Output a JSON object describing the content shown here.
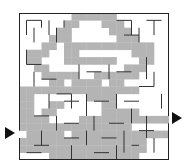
{
  "maze": {
    "cols": 20,
    "rows": 20,
    "entry": {
      "side": "left",
      "row": 16
    },
    "exit": {
      "side": "right",
      "row": 14
    },
    "colors": {
      "background": "#ffffff",
      "wall": "#333333",
      "border": "#222222",
      "solution": "#b4b4b4",
      "arrow": "#111111"
    },
    "solution_cells": [
      [
        0,
        7
      ],
      [
        0,
        8
      ],
      [
        0,
        9
      ],
      [
        0,
        10
      ],
      [
        0,
        11
      ],
      [
        0,
        12
      ],
      [
        1,
        6
      ],
      [
        1,
        7
      ],
      [
        1,
        11
      ],
      [
        1,
        12
      ],
      [
        1,
        13
      ],
      [
        2,
        5
      ],
      [
        2,
        6
      ],
      [
        2,
        12
      ],
      [
        2,
        13
      ],
      [
        2,
        14
      ],
      [
        3,
        4
      ],
      [
        3,
        5
      ],
      [
        3,
        6
      ],
      [
        3,
        13
      ],
      [
        3,
        14
      ],
      [
        3,
        15
      ],
      [
        4,
        3
      ],
      [
        4,
        4
      ],
      [
        4,
        6
      ],
      [
        4,
        7
      ],
      [
        4,
        8
      ],
      [
        4,
        9
      ],
      [
        4,
        10
      ],
      [
        4,
        11
      ],
      [
        4,
        12
      ],
      [
        4,
        13
      ],
      [
        4,
        14
      ],
      [
        4,
        15
      ],
      [
        4,
        16
      ],
      [
        4,
        17
      ],
      [
        5,
        1
      ],
      [
        5,
        2
      ],
      [
        5,
        3
      ],
      [
        5,
        6
      ],
      [
        5,
        7
      ],
      [
        5,
        15
      ],
      [
        5,
        16
      ],
      [
        5,
        17
      ],
      [
        6,
        1
      ],
      [
        6,
        2
      ],
      [
        6,
        6
      ],
      [
        6,
        7
      ],
      [
        6,
        8
      ],
      [
        6,
        9
      ],
      [
        6,
        10
      ],
      [
        6,
        11
      ],
      [
        6,
        12
      ],
      [
        6,
        16
      ],
      [
        6,
        17
      ],
      [
        7,
        2
      ],
      [
        7,
        3
      ],
      [
        7,
        14
      ],
      [
        7,
        15
      ],
      [
        7,
        16
      ],
      [
        8,
        3
      ],
      [
        8,
        4
      ],
      [
        8,
        5
      ],
      [
        8,
        6
      ],
      [
        8,
        7
      ],
      [
        8,
        10
      ],
      [
        8,
        11
      ],
      [
        8,
        12
      ],
      [
        8,
        13
      ],
      [
        8,
        14
      ],
      [
        8,
        15
      ],
      [
        9,
        4
      ],
      [
        9,
        5
      ],
      [
        9,
        7
      ],
      [
        9,
        8
      ],
      [
        9,
        9
      ],
      [
        9,
        10
      ],
      [
        9,
        12
      ],
      [
        9,
        13
      ],
      [
        10,
        0
      ],
      [
        10,
        1
      ],
      [
        10,
        2
      ],
      [
        10,
        3
      ],
      [
        10,
        4
      ],
      [
        10,
        5
      ],
      [
        10,
        6
      ],
      [
        10,
        7
      ],
      [
        10,
        8
      ],
      [
        10,
        9
      ],
      [
        10,
        10
      ],
      [
        10,
        11
      ],
      [
        10,
        12
      ],
      [
        10,
        13
      ],
      [
        10,
        14
      ],
      [
        10,
        15
      ],
      [
        11,
        0
      ],
      [
        11,
        1
      ],
      [
        11,
        9
      ],
      [
        11,
        10
      ],
      [
        11,
        11
      ],
      [
        11,
        12
      ],
      [
        12,
        0
      ],
      [
        12,
        1
      ],
      [
        12,
        4
      ],
      [
        12,
        5
      ],
      [
        12,
        11
      ],
      [
        12,
        12
      ],
      [
        13,
        0
      ],
      [
        13,
        1
      ],
      [
        13,
        3
      ],
      [
        13,
        4
      ],
      [
        13,
        11
      ],
      [
        13,
        12
      ],
      [
        13,
        13
      ],
      [
        13,
        14
      ],
      [
        13,
        15
      ],
      [
        14,
        0
      ],
      [
        14,
        1
      ],
      [
        14,
        2
      ],
      [
        14,
        3
      ],
      [
        14,
        8
      ],
      [
        14,
        9
      ],
      [
        14,
        10
      ],
      [
        14,
        11
      ],
      [
        14,
        12
      ],
      [
        14,
        13
      ],
      [
        14,
        14
      ],
      [
        14,
        15
      ],
      [
        14,
        16
      ],
      [
        14,
        17
      ],
      [
        14,
        18
      ],
      [
        14,
        19
      ],
      [
        15,
        0
      ],
      [
        15,
        1
      ],
      [
        15,
        2
      ],
      [
        15,
        3
      ],
      [
        15,
        4
      ],
      [
        15,
        5
      ],
      [
        15,
        6
      ],
      [
        15,
        7
      ],
      [
        15,
        8
      ],
      [
        15,
        9
      ],
      [
        15,
        10
      ],
      [
        15,
        11
      ],
      [
        15,
        12
      ],
      [
        15,
        13
      ],
      [
        15,
        14
      ],
      [
        16,
        1
      ],
      [
        16,
        2
      ],
      [
        16,
        3
      ],
      [
        16,
        4
      ],
      [
        16,
        5
      ],
      [
        16,
        7
      ],
      [
        16,
        8
      ],
      [
        16,
        9
      ],
      [
        16,
        10
      ],
      [
        16,
        11
      ],
      [
        16,
        12
      ],
      [
        16,
        13
      ],
      [
        16,
        14
      ],
      [
        16,
        15
      ],
      [
        16,
        16
      ],
      [
        16,
        17
      ],
      [
        16,
        18
      ],
      [
        16,
        19
      ],
      [
        17,
        0
      ],
      [
        17,
        1
      ],
      [
        17,
        2
      ],
      [
        17,
        3
      ],
      [
        17,
        4
      ],
      [
        17,
        5
      ],
      [
        17,
        6
      ],
      [
        17,
        7
      ],
      [
        17,
        8
      ],
      [
        17,
        9
      ],
      [
        17,
        10
      ],
      [
        17,
        11
      ],
      [
        17,
        12
      ],
      [
        17,
        13
      ],
      [
        17,
        14
      ],
      [
        17,
        15
      ],
      [
        17,
        16
      ],
      [
        18,
        0
      ],
      [
        18,
        1
      ],
      [
        18,
        2
      ],
      [
        18,
        3
      ],
      [
        18,
        4
      ],
      [
        18,
        5
      ],
      [
        18,
        6
      ],
      [
        18,
        7
      ],
      [
        18,
        8
      ],
      [
        18,
        9
      ],
      [
        18,
        10
      ],
      [
        18,
        11
      ],
      [
        18,
        12
      ],
      [
        18,
        13
      ],
      [
        18,
        14
      ],
      [
        18,
        15
      ],
      [
        18,
        16
      ],
      [
        19,
        4
      ],
      [
        19,
        5
      ],
      [
        19,
        6
      ],
      [
        19,
        7
      ],
      [
        19,
        8
      ],
      [
        19,
        9
      ],
      [
        19,
        10
      ],
      [
        19,
        11
      ],
      [
        19,
        12
      ],
      [
        19,
        13
      ],
      [
        19,
        14
      ],
      [
        19,
        15
      ]
    ],
    "walls": [
      [
        1,
        1,
        1,
        3
      ],
      [
        1,
        1,
        3,
        1
      ],
      [
        3,
        1,
        3,
        2
      ],
      [
        2,
        2,
        2,
        4
      ],
      [
        4,
        1,
        4,
        3
      ],
      [
        5,
        2,
        5,
        4
      ],
      [
        6,
        1,
        6,
        2
      ],
      [
        13,
        1,
        15,
        1
      ],
      [
        15,
        1,
        15,
        3
      ],
      [
        16,
        2,
        16,
        4
      ],
      [
        17,
        1,
        19,
        1
      ],
      [
        18,
        1,
        18,
        3
      ],
      [
        14,
        3,
        16,
        3
      ],
      [
        1,
        5,
        1,
        7
      ],
      [
        1,
        7,
        3,
        7
      ],
      [
        2,
        8,
        2,
        10
      ],
      [
        3,
        9,
        5,
        9
      ],
      [
        4,
        11,
        4,
        13
      ],
      [
        6,
        12,
        8,
        12
      ],
      [
        8,
        7,
        8,
        9
      ],
      [
        9,
        8,
        11,
        8
      ],
      [
        12,
        7,
        12,
        9
      ],
      [
        13,
        8,
        15,
        8
      ],
      [
        17,
        6,
        17,
        9
      ],
      [
        18,
        8,
        18,
        10
      ],
      [
        5,
        11,
        7,
        11
      ],
      [
        7,
        11,
        7,
        13
      ],
      [
        9,
        11,
        9,
        14
      ],
      [
        10,
        12,
        12,
        12
      ],
      [
        13,
        11,
        13,
        13
      ],
      [
        14,
        12,
        16,
        12
      ],
      [
        16,
        10,
        18,
        10
      ],
      [
        19,
        11,
        19,
        13
      ],
      [
        2,
        14,
        4,
        14
      ],
      [
        5,
        14,
        5,
        16
      ],
      [
        6,
        15,
        8,
        15
      ],
      [
        10,
        14,
        10,
        16
      ],
      [
        12,
        15,
        14,
        15
      ],
      [
        15,
        13,
        15,
        15
      ],
      [
        17,
        14,
        17,
        17
      ],
      [
        3,
        16,
        3,
        18
      ],
      [
        6,
        17,
        8,
        17
      ],
      [
        9,
        16,
        9,
        18
      ],
      [
        11,
        17,
        13,
        17
      ],
      [
        14,
        16,
        14,
        19
      ],
      [
        16,
        16,
        18,
        16
      ],
      [
        18,
        17,
        18,
        19
      ],
      [
        2,
        18,
        4,
        18
      ],
      [
        7,
        18,
        7,
        20
      ],
      [
        10,
        19,
        12,
        19
      ],
      [
        13,
        18,
        13,
        20
      ],
      [
        15,
        18,
        16,
        18
      ],
      [
        1,
        19,
        3,
        19
      ]
    ]
  }
}
